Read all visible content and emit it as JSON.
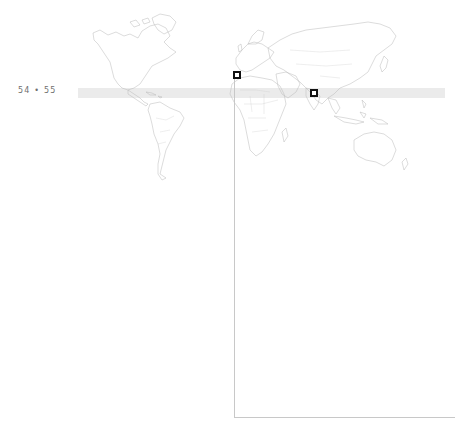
{
  "page": {
    "page_numbers": "54 • 55"
  },
  "map": {
    "projection": "world",
    "highlight_band": {
      "color": "#ebebeb",
      "description": "tropical latitude band"
    },
    "land_stroke_color": "#b9b9b9",
    "markers": [
      {
        "id": "marker-1",
        "region": "north-west-africa / iberia",
        "x": 233,
        "y": 71,
        "color": "#111111"
      },
      {
        "id": "marker-2",
        "region": "south-asia / india",
        "x": 310,
        "y": 89,
        "color": "#111111"
      }
    ],
    "leader_line_color": "#c8c8c8"
  }
}
